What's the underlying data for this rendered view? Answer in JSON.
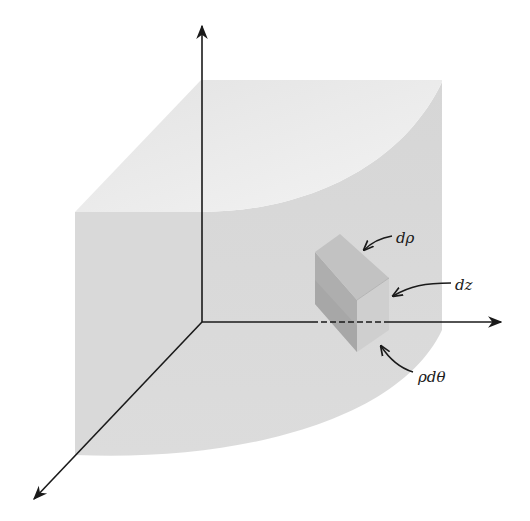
{
  "figure": {
    "labels": {
      "d_rho": "dρ",
      "dz": "dz",
      "rho_dtheta": "ρdθ"
    },
    "axes": [
      "z-axis (vertical)",
      "y-axis (horizontal)",
      "x-axis (diagonal)"
    ],
    "colors": {
      "top_face": "#ececec",
      "side_face": "#d8d8d8",
      "bottom_face": "#dedede",
      "element_dark": "#a9a9a9",
      "element_mid": "#bdbdbd",
      "element_light": "#d0d0d0",
      "axis": "#1a1a1a"
    }
  }
}
